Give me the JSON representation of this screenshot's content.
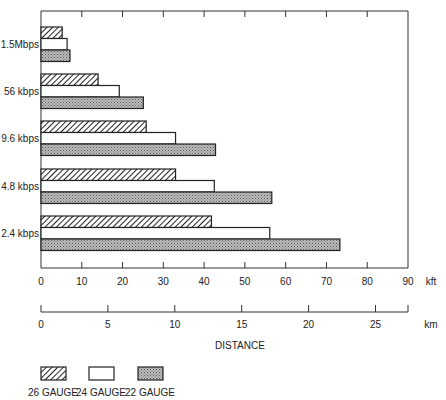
{
  "chart_data": {
    "type": "bar",
    "orientation": "horizontal",
    "title": "",
    "categories": [
      "1.5Mbps",
      "56 kbps",
      "9.6 kbps",
      "4.8 kbps",
      "2.4 kbps"
    ],
    "series": [
      {
        "name": "26 GAUGE",
        "pattern": "diagonal-hatch",
        "values": [
          5.2,
          14.0,
          25.8,
          33.0,
          41.8
        ]
      },
      {
        "name": "24 GAUGE",
        "pattern": "open",
        "values": [
          6.4,
          19.2,
          33.0,
          42.5,
          56.1
        ]
      },
      {
        "name": "22 GAUGE",
        "pattern": "stipple",
        "values": [
          7.1,
          25.1,
          42.8,
          56.6,
          73.3
        ]
      }
    ],
    "xlabel": "DISTANCE",
    "ylabel": "",
    "x_axes": [
      {
        "unit": "kft",
        "range": [
          0,
          90
        ],
        "ticks": [
          0,
          10,
          20,
          30,
          40,
          50,
          60,
          70,
          80,
          90
        ]
      },
      {
        "unit": "km",
        "range": [
          0,
          27.43
        ],
        "ticks": [
          0,
          5,
          10,
          15,
          20,
          25
        ]
      }
    ],
    "grid": false,
    "legend_position": "bottom-left"
  },
  "axis": {
    "kft_unit": "kft",
    "km_unit": "km",
    "xlabel": "DISTANCE"
  },
  "legend": [
    {
      "label": "26 GAUGE",
      "pattern": "hatch"
    },
    {
      "label": "24 GAUGE",
      "pattern": "open"
    },
    {
      "label": "22 GAUGE",
      "pattern": "stipple"
    }
  ]
}
